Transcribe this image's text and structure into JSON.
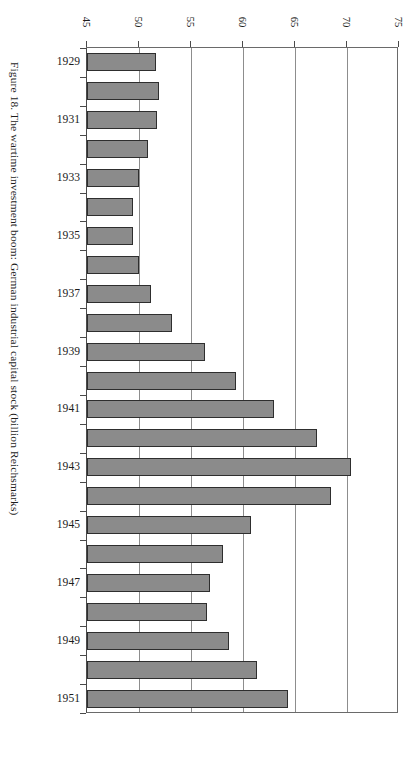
{
  "figure": {
    "caption": "Figure 18. The wartime investment boom: German industrial capital stock (billion Reichsmarks)"
  },
  "chart_data": {
    "type": "bar",
    "orientation": "horizontal",
    "title": "Figure 18. The wartime investment boom: German industrial capital stock (billion Reichsmarks)",
    "xlabel": "",
    "ylabel": "",
    "xlim": [
      45,
      75
    ],
    "xticks": [
      45,
      50,
      55,
      60,
      65,
      70,
      75
    ],
    "xtick_labels": [
      "45",
      "50",
      "55",
      "60",
      "65",
      "70",
      "75"
    ],
    "grid": true,
    "legend": false,
    "units": "billion Reichsmarks",
    "categories": [
      "1929",
      "1930",
      "1931",
      "1932",
      "1933",
      "1934",
      "1935",
      "1936",
      "1937",
      "1938",
      "1939",
      "1940",
      "1941",
      "1942",
      "1943",
      "1944",
      "1945",
      "1946",
      "1947",
      "1948",
      "1949",
      "1950",
      "1951"
    ],
    "labeled_categories": [
      "1929",
      "1931",
      "1933",
      "1935",
      "1937",
      "1939",
      "1941",
      "1943",
      "1945",
      "1947",
      "1949",
      "1951"
    ],
    "values": [
      51.6,
      51.9,
      51.7,
      50.9,
      50.0,
      49.4,
      49.4,
      50.0,
      51.2,
      53.2,
      56.3,
      59.3,
      63.0,
      67.1,
      70.4,
      68.5,
      60.8,
      58.1,
      56.8,
      56.5,
      58.7,
      61.3,
      64.3
    ],
    "bar_fill_color": "#8b8b8b",
    "bar_edge_color": "#2e2e2e",
    "gridline_color": "#8d8d8d",
    "axis_color": "#4a4a4a",
    "background_color": "#ffffff"
  }
}
